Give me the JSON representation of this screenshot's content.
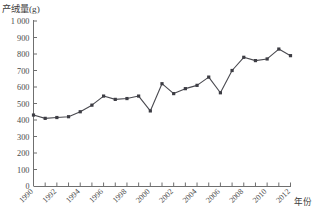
{
  "chart_data": {
    "type": "line",
    "title": "",
    "ylabel": "产绒量(g)",
    "xlabel": "年份",
    "ylim": [
      0,
      1000
    ],
    "ytick_step": 100,
    "ytick_labels": [
      "0",
      "100",
      "200",
      "300",
      "400",
      "500",
      "600",
      "700",
      "800",
      "900",
      "1 000"
    ],
    "xlim": [
      1990,
      2012
    ],
    "xtick_step": 1,
    "xlabel_step": 2,
    "xtick_labels": [
      "1990",
      "1992",
      "1994",
      "1996",
      "1998",
      "2000",
      "2002",
      "2004",
      "2006",
      "2008",
      "2010",
      "2012"
    ],
    "grid": false,
    "legend": "none",
    "marker": "square",
    "x": [
      1990,
      1991,
      1992,
      1993,
      1994,
      1995,
      1996,
      1997,
      1998,
      1999,
      2000,
      2001,
      2002,
      2003,
      2004,
      2005,
      2006,
      2007,
      2008,
      2009,
      2010,
      2011,
      2012
    ],
    "values": [
      430,
      410,
      415,
      420,
      450,
      490,
      545,
      525,
      530,
      545,
      455,
      620,
      560,
      590,
      610,
      660,
      565,
      700,
      780,
      760,
      770,
      830,
      790
    ],
    "series": [
      {
        "name": "产绒量",
        "values": [
          430,
          410,
          415,
          420,
          450,
          490,
          545,
          525,
          530,
          545,
          455,
          620,
          560,
          590,
          610,
          660,
          565,
          700,
          780,
          760,
          770,
          830,
          790
        ]
      }
    ]
  },
  "colors": {
    "axis": "#6f6f6f",
    "line": "#4a4a50",
    "marker": "#3d3d44",
    "text": "#3a3a3a",
    "background": "#ffffff"
  }
}
